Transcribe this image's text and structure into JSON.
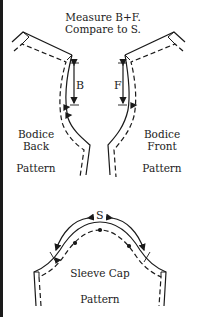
{
  "title": {
    "line1": "Measure B+F.",
    "line2": "Compare to S."
  },
  "bodice_back": {
    "label_line1": "Bodice",
    "label_line2": "Back",
    "pattern": "Pattern",
    "measure_label": "B"
  },
  "bodice_front": {
    "label_line1": "Bodice",
    "label_line2": "Front",
    "pattern": "Pattern",
    "measure_label": "F"
  },
  "sleeve_cap": {
    "label": "Sleeve Cap",
    "pattern": "Pattern",
    "measure_label": "S"
  },
  "colors": {
    "line": "#1a1a1a",
    "background": "#ffffff"
  }
}
